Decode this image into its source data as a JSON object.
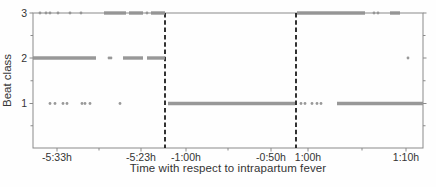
{
  "figure": {
    "xlabel": "Time with respect to intrapartum fever",
    "ylabel": "Beat class"
  },
  "chart_data": {
    "type": "scatter",
    "title": "",
    "xlabel": "Time with respect to intrapartum fever",
    "ylabel": "Beat class",
    "ylim": [
      0,
      3
    ],
    "yticks": [
      1,
      2,
      3
    ],
    "grid": false,
    "legend": "none",
    "point_color": "#939393",
    "axis_color": "#8a8a8a",
    "text_color": "#343434",
    "break_line_color": "#1c1c1c",
    "plot_area_px": {
      "left": 33,
      "top": 13,
      "right": 423,
      "bottom": 148
    },
    "break_lines_px": [
      165,
      296
    ],
    "x_segments": [
      {
        "start_px": 33,
        "end_px": 165,
        "minor_px": [
          99
        ],
        "ticks": [
          {
            "label": "-5:33h",
            "px": 57
          },
          {
            "label": "-5:23h",
            "px": 141
          }
        ]
      },
      {
        "start_px": 165,
        "end_px": 296,
        "minor_px": [
          228
        ],
        "ticks": [
          {
            "label": "-1:00h",
            "px": 186
          },
          {
            "label": "-0:50h",
            "px": 271
          }
        ]
      },
      {
        "start_px": 296,
        "end_px": 423,
        "minor_px": [
          362
        ],
        "ticks": [
          {
            "label": "1:00h",
            "px": 308
          },
          {
            "label": "1:10h",
            "px": 406
          }
        ]
      }
    ],
    "y_ticks": [
      {
        "label": "3",
        "y_px": 13
      },
      {
        "label": "2",
        "y_px": 58
      },
      {
        "label": "1",
        "y_px": 103.5
      }
    ],
    "y_minor_px": [
      35.5,
      80.75,
      125.75
    ],
    "class_rows": [
      {
        "class": 3,
        "y_px": 13,
        "dense_px": [
          [
            104,
            126
          ],
          [
            129,
            143
          ],
          [
            151,
            165
          ],
          [
            297,
            365
          ],
          [
            390,
            400
          ]
        ],
        "sparse_px": [
          40,
          46,
          50,
          58,
          70,
          81,
          147,
          374,
          378
        ]
      },
      {
        "class": 2,
        "y_px": 58,
        "dense_px": [
          [
            33,
            96
          ],
          [
            123,
            143
          ],
          [
            147,
            165
          ]
        ],
        "sparse_px": [
          109,
          111,
          408
        ]
      },
      {
        "class": 1,
        "y_px": 103.5,
        "dense_px": [
          [
            168,
            295
          ],
          [
            337,
            423
          ]
        ],
        "sparse_px": [
          50,
          55,
          63,
          67,
          82,
          85,
          90,
          120,
          301,
          305,
          312,
          317,
          321
        ]
      }
    ]
  }
}
